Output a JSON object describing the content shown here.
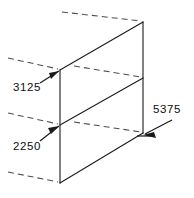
{
  "diagram": {
    "type": "isometric-dimension-drawing",
    "background_color": "#ffffff",
    "solid_line_color": "#1a1a1a",
    "hidden_line_color": "#4d4d4d",
    "text_color": "#0d0d0d",
    "dimensions": [
      {
        "id": "upper-left",
        "value": "3125",
        "label_x": 13,
        "label_y": 88,
        "leader_from_x": 40,
        "leader_from_y": 83,
        "leader_to_x": 59,
        "leader_to_y": 71,
        "arrow_angle_deg": -32,
        "points_to": "upper-left-vertex"
      },
      {
        "id": "lower-left",
        "value": "2250",
        "label_x": 13,
        "label_y": 147,
        "leader_from_x": 40,
        "leader_from_y": 141,
        "leader_to_x": 59,
        "leader_to_y": 126,
        "arrow_angle_deg": -38,
        "points_to": "mid-left-vertex"
      },
      {
        "id": "right",
        "value": "5375",
        "label_x": 153,
        "label_y": 110,
        "leader_from_x": 172,
        "leader_from_y": 120,
        "leader_to_x": 145,
        "leader_to_y": 134,
        "arrow_angle_deg": 152,
        "points_to": "bottom-right-vertex"
      }
    ],
    "solid_edges": [
      {
        "name": "top-diagonal-edge",
        "x1": 60,
        "y1": 70,
        "x2": 143,
        "y2": 22
      },
      {
        "name": "middle-diagonal-edge",
        "x1": 60,
        "y1": 125,
        "x2": 143,
        "y2": 78
      },
      {
        "name": "bottom-diagonal-edge",
        "x1": 60,
        "y1": 183,
        "x2": 143,
        "y2": 133
      },
      {
        "name": "left-vertical-edge",
        "x1": 60,
        "y1": 70,
        "x2": 60,
        "y2": 183
      },
      {
        "name": "right-vertical-edge",
        "x1": 143,
        "y1": 22,
        "x2": 143,
        "y2": 133
      }
    ],
    "hidden_edges": [
      {
        "name": "top-rear-projection",
        "x1": 62,
        "y1": 12,
        "x2": 141,
        "y2": 21
      },
      {
        "name": "upper-left-projection",
        "x1": 8,
        "y1": 58,
        "x2": 58,
        "y2": 69
      },
      {
        "name": "mid-left-projection",
        "x1": 8,
        "y1": 113,
        "x2": 58,
        "y2": 124
      },
      {
        "name": "bottom-left-projection",
        "x1": 8,
        "y1": 172,
        "x2": 58,
        "y2": 182
      },
      {
        "name": "mid-rear-projection",
        "x1": 74,
        "y1": 66,
        "x2": 141,
        "y2": 77
      },
      {
        "name": "bottom-rear-projection",
        "x1": 74,
        "y1": 122,
        "x2": 141,
        "y2": 132
      }
    ]
  }
}
